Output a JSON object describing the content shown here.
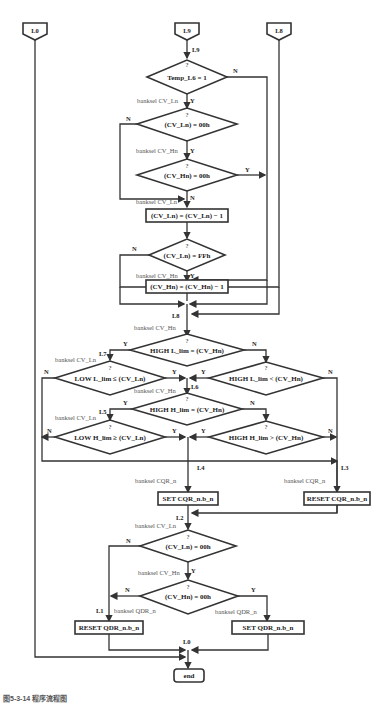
{
  "connectors": {
    "top_left": "L0",
    "top_center": "L9",
    "top_right": "L8"
  },
  "labels": {
    "l9": "L9",
    "l8": "L8",
    "l7": "L7",
    "l6": "L6",
    "l5": "L5",
    "l4": "L4",
    "l3": "L3",
    "l2": "L2",
    "l1": "L1",
    "l0": "L0"
  },
  "banksel": {
    "cv_ln": "banksel CV_Ln",
    "cv_hn": "banksel CV_Hn",
    "cqr_n": "banksel CQR_n",
    "qdr_n": "banksel QDR_n"
  },
  "decisions": {
    "d1": "Temp_L6 = 1",
    "d2": "(CV_Ln) = 00h",
    "d3": "(CV_Hn) = 00h",
    "d4": "(CV_Ln) = FFh",
    "d5": "HIGH L_lim = (CV_Hn)",
    "d6": "LOW L_lim ≤ (CV_Ln)",
    "d7": "HIGH L_lim < (CV_Hn)",
    "d8": "HIGH H_lim = (CV_Hn)",
    "d9": "LOW H_lim ≥ (CV_Ln)",
    "d10": "HIGH H_lim > (CV_Hn)",
    "d11": "(CV_Ln) = 00h",
    "d12": "(CV_Hn) = 00h"
  },
  "processes": {
    "p1": "(CV_Ln) = (CV_Ln) − 1",
    "p2": "(CV_Hn) = (CV_Hn) − 1",
    "p3": "SET CQR_n.b_n",
    "p4": "RESET CQR_n.b_n",
    "p5": "RESET QDR_n.b_n",
    "p6": "SET QDR_n.b_n"
  },
  "terminal": {
    "end": "end"
  },
  "branch": {
    "q": "?",
    "y": "Y",
    "n": "N"
  },
  "caption": "图5-3-14  程序流程图"
}
